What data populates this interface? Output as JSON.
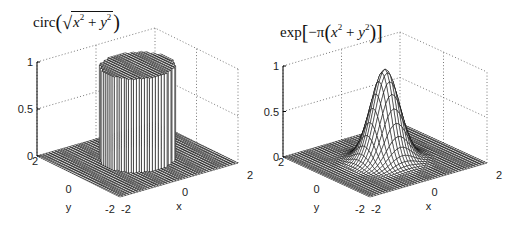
{
  "figure": {
    "background": "#ffffff",
    "line_color": "#000000"
  },
  "chart_data": [
    {
      "type": "surface",
      "title": "circ(√(x² + y²))",
      "title_parts": {
        "fn": "circ",
        "open": "(",
        "radical": "√",
        "x": "x",
        "plus": "+",
        "y": "y",
        "exp": "2",
        "close": ")"
      },
      "xlabel": "x",
      "ylabel": "y",
      "zlabel": "",
      "xlim": [
        -2,
        2
      ],
      "ylim": [
        -2,
        2
      ],
      "zlim": [
        0,
        1
      ],
      "xticks": [
        "-2",
        "0",
        "2"
      ],
      "yticks": [
        "-2",
        "0",
        "2"
      ],
      "zticks": [
        "0",
        "0.5",
        "1"
      ],
      "grid": true,
      "function": "z = 1 if sqrt(x^2+y^2) <= 1 else 0",
      "description": "Cylinder of height 1 and radius 1 centered at origin on a flat zero plane"
    },
    {
      "type": "surface",
      "title": "exp[-π(x² + y²)]",
      "title_parts": {
        "fn": "exp",
        "lb": "[",
        "minus_pi": "−π",
        "open": "(",
        "x": "x",
        "plus": "+",
        "y": "y",
        "exp": "2",
        "close": ")",
        "rb": "]"
      },
      "xlabel": "x",
      "ylabel": "y",
      "zlabel": "",
      "xlim": [
        -2,
        2
      ],
      "ylim": [
        -2,
        2
      ],
      "zlim": [
        0,
        1
      ],
      "xticks": [
        "-2",
        "0",
        "2"
      ],
      "yticks": [
        "-2",
        "0",
        "2"
      ],
      "zticks": [
        "0",
        "0.5",
        "1"
      ],
      "grid": true,
      "function": "z = exp(-pi*(x^2+y^2))",
      "description": "Gaussian bump peaking at 1 at origin, decaying to 0"
    }
  ],
  "plots": [
    {
      "origin": {
        "left": [
          37,
          156
        ],
        "front": [
          120,
          197
        ],
        "right": [
          238,
          163
        ],
        "back": [
          150,
          128
        ]
      },
      "zheight": 94,
      "kind": "circ"
    },
    {
      "origin": {
        "left": [
          283,
          157
        ],
        "front": [
          370,
          197
        ],
        "right": [
          487,
          163
        ],
        "back": [
          400,
          130
        ]
      },
      "zheight": 91,
      "kind": "gauss"
    }
  ]
}
